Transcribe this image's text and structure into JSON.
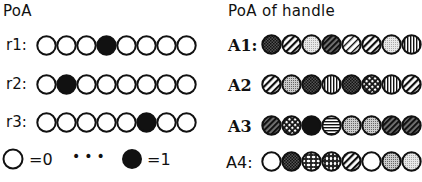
{
  "left_panel": {
    "title": "PoA",
    "rows": [
      {
        "label": "r1:",
        "values": [
          0,
          0,
          0,
          1,
          0,
          0,
          0,
          0
        ]
      },
      {
        "label": "r2:",
        "values": [
          0,
          1,
          0,
          0,
          0,
          0,
          0,
          0
        ]
      },
      {
        "label": "r3:",
        "values": [
          0,
          0,
          0,
          0,
          0,
          1,
          0,
          0
        ]
      }
    ],
    "legend": {
      "zero_label": "=0",
      "ellipsis": "•••",
      "one_label": "=1"
    }
  },
  "right_panel": {
    "title": "PoA of handle",
    "rows": [
      {
        "label": "A1:",
        "patterns": [
          "crosshatch-dark",
          "diag-wide",
          "dots-light",
          "diag-dense",
          "diag-thin",
          "diag-wide",
          "dots-light",
          "vertical"
        ]
      },
      {
        "label": "A2",
        "patterns": [
          "diag-wide",
          "dots-medium",
          "crosshatch-dark",
          "vertical",
          "crosshatch-dark",
          "checker",
          "vertical",
          "diag-wide"
        ]
      },
      {
        "label": "A3",
        "patterns": [
          "diag-dense",
          "checker",
          "solid",
          "horizontal",
          "dots-medium",
          "dots-medium",
          "diag-dense",
          "diag-dense"
        ]
      },
      {
        "label": "A4:",
        "patterns": [
          "white",
          "crosshatch-dark",
          "spots-h",
          "spots-v",
          "diag-wide",
          "white",
          "dots-medium",
          "dots-light"
        ]
      }
    ]
  }
}
